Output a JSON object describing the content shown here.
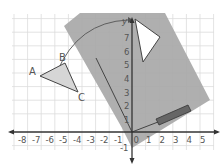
{
  "diagram": {
    "type": "coordinate-plane-rotation",
    "axes": {
      "x_ticks": [
        "-8",
        "-7",
        "-6",
        "-5",
        "-4",
        "-3",
        "-2",
        "-1",
        "0",
        "1",
        "2",
        "3",
        "4",
        "5"
      ],
      "y_ticks": [
        "1",
        "2",
        "3",
        "4",
        "5",
        "6",
        "7"
      ],
      "y_neg_ticks": [
        "-1"
      ],
      "y_label": "y"
    },
    "triangle": {
      "vertices": [
        {
          "label": "A"
        },
        {
          "label": "B"
        },
        {
          "label": "C"
        }
      ]
    },
    "colors": {
      "grid": "#d8d8d8",
      "tracing_paper": "#a8a8a8",
      "triangle_fill": "#d0d0d0",
      "axis": "#333333",
      "pencil": "#555555"
    }
  }
}
